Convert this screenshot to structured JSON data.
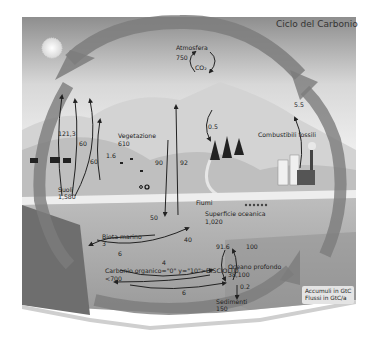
{
  "title": "Ciclo del Carbonio",
  "legend": {
    "line1": "Accumuli in GtC",
    "line2": "Flussi in GtC/a"
  },
  "reservoirs": {
    "atmosphere": {
      "name": "Atmosfera",
      "value": "750",
      "gas": "CO₂"
    },
    "vegetation": {
      "name": "Vegetazione",
      "value": "610"
    },
    "soils": {
      "name": "Suoli",
      "value": "1,580"
    },
    "fossil_fuels": {
      "name": "Combustibili fossili"
    },
    "rivers": {
      "name": "Fiumi"
    },
    "surface_ocean": {
      "name": "Superficie oceanica",
      "value": "1,020"
    },
    "marine_biota": {
      "name": "Biota marino",
      "value": "3"
    },
    "organic_carbon": {
      "name": "Carbonio organico=\"0\" y=\"10\">DISCIOLTO",
      "value": "<700"
    },
    "deep_ocean": {
      "name": "Oceano profondo",
      "value": "38,100"
    },
    "sediments": {
      "name": "Sedimenti",
      "value": "150"
    }
  },
  "fluxes": {
    "f_121_3": "121,3",
    "f_60_a": "60",
    "f_60_b": "60",
    "f_1_6": "1.6",
    "f_90": "90",
    "f_92": "92",
    "f_0_5": "0.5",
    "f_5_5": "5.5",
    "f_50": "50",
    "f_40": "40",
    "f_6": "6",
    "f_4": "4",
    "f_91_6": "91.6",
    "f_100": "100",
    "f_0_2": "0.2",
    "f_6_b": "6"
  },
  "colors": {
    "sky_top": "#8e8e8e",
    "sky_bottom": "#f2f2f2",
    "big_arrow": "#7a7a7a",
    "land": "#c9c9c9",
    "ocean": "#a6a6a6",
    "deep_ocean": "#9a9a9a",
    "side_face": "#6a6a6a",
    "text": "#222222"
  }
}
